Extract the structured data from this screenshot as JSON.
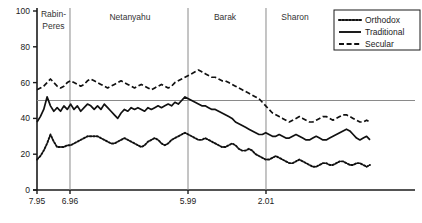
{
  "chart_data": {
    "type": "line",
    "title": "",
    "xlabel": "",
    "ylabel": "",
    "ylim": [
      0,
      100
    ],
    "yticks": [
      0,
      20,
      40,
      60,
      80,
      100
    ],
    "xticks": [
      "7.95",
      "6.96",
      "5.99",
      "2.01"
    ],
    "xtick_positions": [
      0.0,
      0.0873,
      0.3995,
      0.6058
    ],
    "grid": false,
    "legend_position": "top-right",
    "reference_line": {
      "axis": "y",
      "value": 50,
      "color": "#8a8a8a"
    },
    "annotations": [
      {
        "label": "Rabin-‐Peres",
        "line1": "Rabin-",
        "line2": "Peres",
        "center": 0.0436
      },
      {
        "label": "Netanyahu",
        "line1": "Netanyahu",
        "line2": "",
        "center": 0.246
      },
      {
        "label": "Barak",
        "line1": "Barak",
        "line2": "",
        "center": 0.4974
      },
      {
        "label": "Sharon",
        "line1": "Sharon",
        "line2": "",
        "center": 0.6825
      }
    ],
    "divider_positions": [
      0.0873,
      0.3995,
      0.6058
    ],
    "series": [
      {
        "name": "Orthodox",
        "style": "dotted",
        "color": "#111111",
        "values": [
          17,
          19,
          22,
          26,
          31,
          27,
          24,
          24,
          24,
          25,
          25,
          26,
          27,
          28,
          29,
          30,
          30,
          30,
          30,
          29,
          28,
          27,
          26,
          26,
          27,
          28,
          29,
          28,
          27,
          26,
          25,
          24,
          25,
          27,
          28,
          29,
          28,
          26,
          25,
          26,
          28,
          29,
          30,
          31,
          32,
          31,
          30,
          29,
          28,
          28,
          29,
          28,
          27,
          26,
          25,
          24,
          24,
          25,
          26,
          25,
          23,
          22,
          22,
          23,
          22,
          20,
          19,
          18,
          17,
          17,
          18,
          19,
          18,
          17,
          16,
          15,
          15,
          16,
          17,
          16,
          15,
          14,
          13,
          13,
          14,
          15,
          15,
          14,
          14,
          15,
          16,
          16,
          15,
          14,
          14,
          15,
          15,
          14,
          13,
          14
        ]
      },
      {
        "name": "Traditional",
        "style": "solid",
        "color": "#111111",
        "values": [
          38,
          41,
          45,
          52,
          47,
          44,
          46,
          44,
          47,
          45,
          48,
          45,
          47,
          44,
          46,
          48,
          47,
          45,
          47,
          45,
          48,
          46,
          44,
          42,
          40,
          43,
          45,
          44,
          46,
          45,
          46,
          45,
          44,
          46,
          45,
          46,
          47,
          46,
          47,
          48,
          47,
          49,
          48,
          50,
          52,
          51,
          50,
          49,
          48,
          47,
          47,
          46,
          45,
          45,
          44,
          43,
          42,
          41,
          40,
          38,
          37,
          36,
          35,
          34,
          33,
          32,
          31,
          31,
          32,
          31,
          30,
          30,
          31,
          30,
          29,
          29,
          30,
          31,
          30,
          29,
          28,
          28,
          29,
          30,
          29,
          28,
          28,
          29,
          30,
          31,
          32,
          33,
          34,
          33,
          31,
          29,
          28,
          29,
          30,
          28
        ]
      },
      {
        "name": "Secular",
        "style": "dashed",
        "color": "#111111",
        "values": [
          56,
          57,
          58,
          60,
          62,
          60,
          58,
          57,
          58,
          60,
          61,
          60,
          59,
          58,
          59,
          61,
          62,
          61,
          60,
          59,
          58,
          57,
          58,
          59,
          60,
          61,
          60,
          59,
          58,
          57,
          58,
          59,
          58,
          57,
          56,
          57,
          58,
          59,
          58,
          57,
          58,
          60,
          61,
          62,
          63,
          64,
          65,
          66,
          67,
          66,
          65,
          64,
          63,
          63,
          62,
          61,
          61,
          60,
          59,
          58,
          57,
          56,
          55,
          54,
          53,
          52,
          51,
          49,
          47,
          45,
          43,
          42,
          41,
          40,
          39,
          38,
          39,
          40,
          41,
          40,
          39,
          38,
          38,
          39,
          40,
          41,
          41,
          40,
          39,
          40,
          41,
          42,
          42,
          41,
          40,
          39,
          38,
          38,
          39,
          38
        ]
      }
    ]
  },
  "legend": {
    "items": [
      {
        "label": "Orthodox",
        "style": "dotted"
      },
      {
        "label": "Traditional",
        "style": "solid"
      },
      {
        "label": "Secular",
        "style": "dashed"
      }
    ]
  },
  "axis": {
    "y_labels": [
      "100",
      "80",
      "60",
      "40",
      "20",
      "0"
    ],
    "x_labels": [
      "7.95",
      "6.96",
      "5.99",
      "2.01"
    ]
  }
}
